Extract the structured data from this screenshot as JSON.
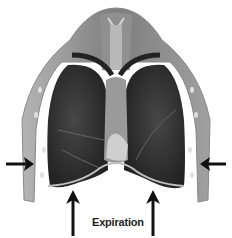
{
  "figure": {
    "label": "Expiration",
    "arrows": [
      {
        "name": "left-inward-arrow",
        "direction": "right"
      },
      {
        "name": "right-inward-arrow",
        "direction": "left"
      },
      {
        "name": "bottom-left-upward-arrow",
        "direction": "up"
      },
      {
        "name": "bottom-right-upward-arrow",
        "direction": "up"
      }
    ],
    "colors": {
      "lung": "#2a2a2a",
      "chest_wall": "#8a8a8a",
      "arrow": "#111111",
      "background": "#ffffff"
    }
  }
}
